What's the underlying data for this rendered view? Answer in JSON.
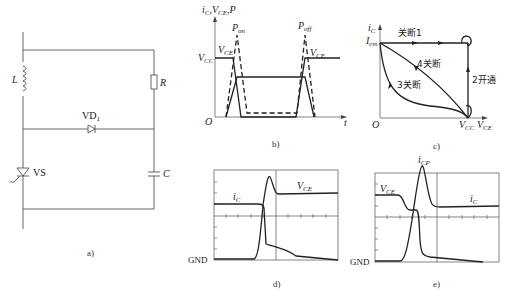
{
  "panel_a": {
    "caption": "a)",
    "components": {
      "inductor": "L",
      "resistor": "R",
      "diode": "VD",
      "diode_sub": "1",
      "thyristor": "VS",
      "capacitor": "C"
    }
  },
  "panel_b": {
    "caption": "b)",
    "y_axis_label": "i",
    "y_axis_label_sub": "C",
    "y_axis_label_rest": ",V",
    "y_axis_label_rest_sub": "CE",
    "y_axis_label_tail": ",P",
    "x_axis_label": "t",
    "origin_label": "O",
    "vcc_label": "V",
    "vcc_sub": "CC",
    "vce_left_label": "V",
    "vce_left_sub": "CE",
    "vce_right_label": "V",
    "vce_right_sub": "CE",
    "pon_label": "P",
    "pon_sub": "on",
    "poff_label": "P",
    "poff_sub": "off"
  },
  "panel_c": {
    "caption": "c)",
    "y_axis_label": "i",
    "y_axis_label_sub": "C",
    "icm_label": "I",
    "icm_sub": "cm",
    "origin_label": "O",
    "vcc_label": "V",
    "vcc_sub": "CC",
    "vce_label": "V",
    "vce_sub": "CE",
    "path_1": "关断1",
    "path_2": "2开通",
    "path_3": "3关断",
    "path_4": "4关断"
  },
  "panel_d": {
    "caption": "d)",
    "gnd_label": "GND",
    "ic_label": "i",
    "ic_sub": "C",
    "vce_label": "V",
    "vce_sub": "CE"
  },
  "panel_e": {
    "caption": "e)",
    "gnd_label": "GND",
    "icp_label": "i",
    "icp_sub": "CP",
    "vce_label": "V",
    "vce_sub": "CE",
    "ic_label": "i",
    "ic_sub": "C"
  }
}
